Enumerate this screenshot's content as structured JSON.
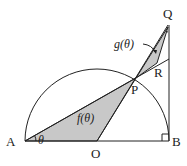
{
  "diagram": {
    "points": {
      "A": "A",
      "B": "B",
      "O": "O",
      "P": "P",
      "Q": "Q",
      "R": "R"
    },
    "angle_label": "θ",
    "region_labels": {
      "f": "f(θ)",
      "g": "g(θ)"
    },
    "colors": {
      "shade": "#c8c8c8",
      "line": "#222222"
    }
  }
}
